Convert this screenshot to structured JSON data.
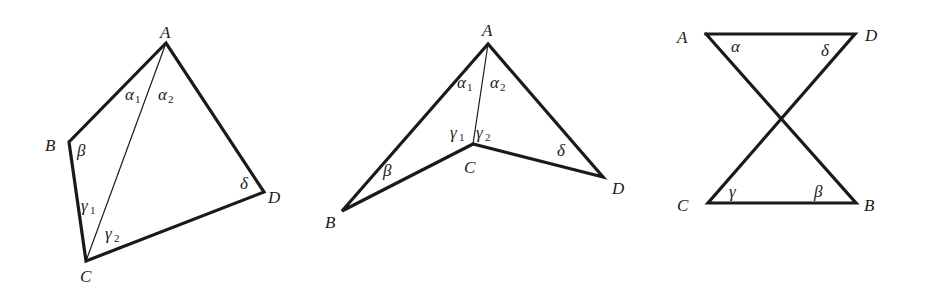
{
  "colors": {
    "line": "#1a1a1a",
    "background": "#ffffff"
  },
  "figures": [
    {
      "name": "convex-quadrilateral",
      "vertices": {
        "A": {
          "label": "A",
          "x": 166,
          "y": 43
        },
        "B": {
          "label": "B",
          "x": 69,
          "y": 142
        },
        "C": {
          "label": "C",
          "x": 86,
          "y": 261
        },
        "D": {
          "label": "D",
          "x": 264,
          "y": 192
        }
      },
      "diagonal": [
        "A",
        "C"
      ],
      "angles": {
        "alpha1": {
          "symbol": "α",
          "sub": "1"
        },
        "alpha2": {
          "symbol": "α",
          "sub": "2"
        },
        "beta": {
          "symbol": "β"
        },
        "gamma1": {
          "symbol": "γ",
          "sub": "1"
        },
        "gamma2": {
          "symbol": "γ",
          "sub": "2"
        },
        "delta": {
          "symbol": "δ"
        }
      }
    },
    {
      "name": "concave-quadrilateral",
      "vertices": {
        "A": {
          "label": "A",
          "x": 488,
          "y": 44
        },
        "B": {
          "label": "B",
          "x": 342,
          "y": 211
        },
        "C": {
          "label": "C",
          "x": 473,
          "y": 144
        },
        "D": {
          "label": "D",
          "x": 603,
          "y": 177
        }
      },
      "diagonal": [
        "A",
        "C"
      ],
      "angles": {
        "alpha1": {
          "symbol": "α",
          "sub": "1"
        },
        "alpha2": {
          "symbol": "α",
          "sub": "2"
        },
        "beta": {
          "symbol": "β"
        },
        "gamma1": {
          "symbol": "γ",
          "sub": "1"
        },
        "gamma2": {
          "symbol": "γ",
          "sub": "2"
        },
        "delta": {
          "symbol": "δ"
        }
      }
    },
    {
      "name": "crossed-quadrilateral",
      "vertices": {
        "A": {
          "label": "A",
          "x": 706,
          "y": 34
        },
        "D": {
          "label": "D",
          "x": 855,
          "y": 34
        },
        "C": {
          "label": "C",
          "x": 708,
          "y": 203
        },
        "B": {
          "label": "B",
          "x": 856,
          "y": 203
        }
      },
      "angles": {
        "alpha": {
          "symbol": "α"
        },
        "beta": {
          "symbol": "β"
        },
        "gamma": {
          "symbol": "γ"
        },
        "delta": {
          "symbol": "δ"
        }
      }
    }
  ]
}
